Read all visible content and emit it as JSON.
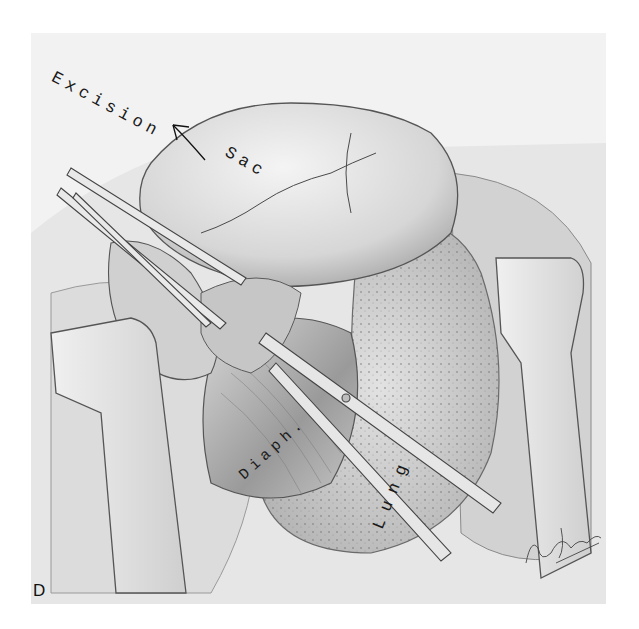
{
  "figure": {
    "panel_letter": "D",
    "labels": {
      "excision": "Excision",
      "sac": "Sac",
      "diaphragm": "Diaph.",
      "lung": "Lung"
    },
    "colors": {
      "background": "#ffffff",
      "paper": "#f2f2f2",
      "ink": "#1a1a1a",
      "tissue_light": "#e4e4e4",
      "tissue_mid": "#c8c8c8",
      "tissue_dark": "#8a8a8a"
    }
  }
}
